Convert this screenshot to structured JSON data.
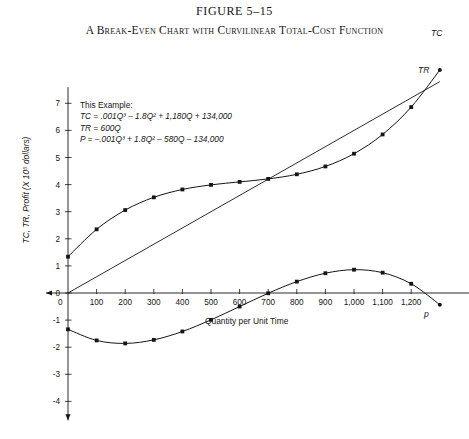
{
  "figure": {
    "number": "FIGURE 5–15",
    "title": "A Break-Even Chart with Curvilinear Total-Cost Function"
  },
  "example": {
    "heading": "This Example:",
    "tc_equation": "TC = .001Q³ – 1.8Q² + 1,180Q + 134,000",
    "tr_equation": "TR = 600Q",
    "p_equation": "P = –.001Q³ + 1.8Q² – 580Q – 134,000"
  },
  "axes": {
    "x_title": "Quantity per Unit Time",
    "y_title": "TC, TR, Profit (X 10⁵ dollars)",
    "x_ticks": [
      "100",
      "200",
      "300",
      "400",
      "500",
      "600",
      "700",
      "800",
      "900",
      "1,000",
      "1,100",
      "1,200"
    ],
    "y_ticks": [
      "7",
      "6",
      "5",
      "4",
      "3",
      "2",
      "1",
      "0",
      "-1",
      "-2",
      "-3",
      "-4"
    ],
    "origin_label": "0"
  },
  "series_labels": {
    "tc": "TC",
    "tr": "TR",
    "profit": "p"
  },
  "colors": {
    "ink": "#151515",
    "curve": "#1a1a1a",
    "background": "#ffffff"
  },
  "chart_data": {
    "type": "line",
    "title": "A Break-Even Chart with Curvilinear Total-Cost Function",
    "xlabel": "Quantity per Unit Time",
    "ylabel": "TC, TR, Profit (X 10⁵ dollars)",
    "xlim": [
      0,
      1300
    ],
    "ylim": [
      -4,
      7.5
    ],
    "grid": false,
    "legend": "inline-labels-at-curve-ends",
    "units_note": "y values are in hundred-thousands (10^5) of dollars",
    "x": [
      0,
      100,
      200,
      300,
      400,
      500,
      600,
      700,
      800,
      900,
      1000,
      1100,
      1200,
      1300
    ],
    "series": [
      {
        "name": "TC",
        "equation": "TC = .001Q³ - 1.8Q² + 1,180Q + 134,000",
        "values": [
          1.34,
          2.35,
          3.06,
          3.53,
          3.82,
          3.99,
          4.1,
          4.21,
          4.38,
          4.67,
          5.14,
          5.85,
          6.86,
          8.23
        ]
      },
      {
        "name": "TR",
        "equation": "TR = 600Q",
        "values": [
          0,
          0.6,
          1.2,
          1.8,
          2.4,
          3.0,
          3.6,
          4.2,
          4.8,
          5.4,
          6.0,
          6.6,
          7.2,
          7.8
        ]
      },
      {
        "name": "p",
        "equation": "P = -.001Q³ + 1.8Q² - 580Q - 134,000",
        "values": [
          -1.34,
          -1.75,
          -1.86,
          -1.73,
          -1.42,
          -0.99,
          -0.5,
          -0.01,
          0.42,
          0.73,
          0.86,
          0.75,
          0.34,
          -0.43
        ]
      }
    ],
    "break_even_quantity": 700,
    "max_profit_quantity": 1000
  }
}
